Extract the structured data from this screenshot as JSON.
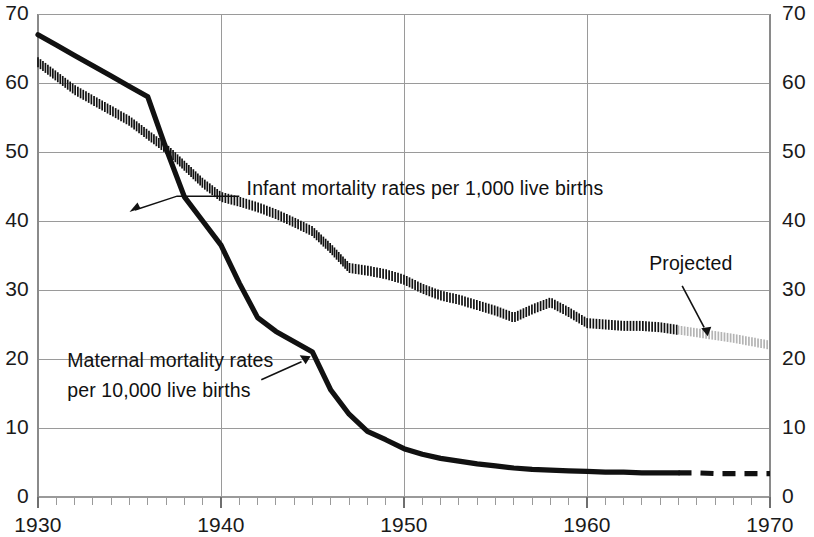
{
  "chart_data": {
    "type": "line",
    "title": "",
    "subtitle": "",
    "xlabel": "",
    "ylabel": "",
    "xlim": [
      1930,
      1970
    ],
    "ylim": [
      0,
      70
    ],
    "grid": true,
    "legend_position": "inline-annotations",
    "x_ticks_major": [
      1930,
      1940,
      1950,
      1960,
      1970
    ],
    "x_tick_labels": [
      "1930",
      "1940",
      "1950",
      "1960",
      "1970"
    ],
    "x_minor_tick_interval": 1,
    "y_ticks": [
      0,
      10,
      20,
      30,
      40,
      50,
      60,
      70
    ],
    "y_tick_labels_left": [
      "0",
      "10",
      "20",
      "30",
      "40",
      "50",
      "60",
      "70"
    ],
    "y_tick_labels_right": [
      "0",
      "10",
      "20",
      "30",
      "40",
      "50",
      "60",
      "70"
    ],
    "series": [
      {
        "name": "Infant mortality rates per 1,000 live births",
        "style": "hatched",
        "color": "#111111",
        "projected_color": "#b4b4b4",
        "projection_start_year": 1965,
        "x": [
          1930,
          1931,
          1932,
          1933,
          1934,
          1935,
          1936,
          1937,
          1938,
          1939,
          1940,
          1941,
          1942,
          1943,
          1944,
          1945,
          1946,
          1947,
          1948,
          1949,
          1950,
          1951,
          1952,
          1953,
          1954,
          1955,
          1956,
          1957,
          1958,
          1959,
          1960,
          1961,
          1962,
          1963,
          1964,
          1965,
          1966,
          1967,
          1968,
          1969,
          1970
        ],
        "values": [
          63.0,
          61.0,
          59.0,
          57.5,
          56.0,
          54.5,
          52.5,
          50.5,
          48.0,
          45.5,
          43.5,
          42.8,
          42.0,
          41.0,
          39.8,
          38.5,
          36.0,
          33.2,
          32.8,
          32.3,
          31.5,
          30.2,
          29.2,
          28.6,
          27.8,
          27.0,
          26.0,
          27.2,
          28.2,
          26.8,
          25.2,
          25.0,
          24.8,
          24.8,
          24.6,
          24.2,
          23.8,
          23.4,
          23.0,
          22.5,
          22.0
        ]
      },
      {
        "name": "Maternal mortality rates per 10,000 live births",
        "style": "solid",
        "color": "#111111",
        "projected_color": "#111111",
        "projected_style": "dashed",
        "projection_start_year": 1965,
        "x": [
          1930,
          1931,
          1932,
          1933,
          1934,
          1935,
          1936,
          1937,
          1938,
          1939,
          1940,
          1941,
          1942,
          1943,
          1944,
          1945,
          1946,
          1947,
          1948,
          1949,
          1950,
          1951,
          1952,
          1953,
          1954,
          1955,
          1956,
          1957,
          1958,
          1959,
          1960,
          1961,
          1962,
          1963,
          1964,
          1965,
          1966,
          1967,
          1968,
          1969,
          1970
        ],
        "values": [
          67.0,
          65.5,
          64.0,
          62.5,
          61.0,
          59.5,
          58.0,
          50.5,
          43.5,
          40.0,
          36.5,
          31.0,
          26.0,
          24.0,
          22.5,
          21.0,
          15.5,
          12.0,
          9.5,
          8.3,
          7.0,
          6.2,
          5.6,
          5.2,
          4.8,
          4.5,
          4.2,
          4.0,
          3.9,
          3.8,
          3.7,
          3.6,
          3.6,
          3.5,
          3.5,
          3.5,
          3.5,
          3.4,
          3.4,
          3.4,
          3.4
        ]
      }
    ],
    "annotations": [
      {
        "id": "infant-label",
        "text": "Infant mortality rates per 1,000 live births",
        "anchor_year": 1941.5,
        "anchor_value": 42.5
      },
      {
        "id": "maternal-label",
        "line1": "Maternal mortality rates",
        "line2": "per 10,000 live births",
        "anchor_year": 1944.5,
        "anchor_value": 20.5
      },
      {
        "id": "projected-label",
        "text": "Projected",
        "anchor_year": 1966.5,
        "anchor_value": 23.5
      }
    ]
  },
  "axes": {
    "left_labels": [
      "70",
      "60",
      "50",
      "40",
      "30",
      "20",
      "10",
      "0"
    ],
    "right_labels": [
      "70",
      "60",
      "50",
      "40",
      "30",
      "20",
      "10",
      "0"
    ],
    "bottom_labels": [
      "1930",
      "1940",
      "1950",
      "1960",
      "1970"
    ]
  },
  "annotations": {
    "infant": "Infant mortality rates per 1,000 live births",
    "maternal_line1": "Maternal mortality rates",
    "maternal_line2": "per 10,000 live births",
    "projected": "Projected"
  },
  "colors": {
    "ink": "#111111",
    "grid": "#9a9a9a",
    "axis": "#8a8a8a",
    "projected": "#b4b4b4",
    "background": "#ffffff"
  }
}
